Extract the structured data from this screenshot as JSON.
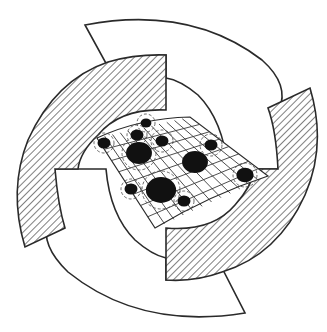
{
  "diagram": {
    "title": "",
    "colors": {
      "stroke": "#2a2a2a",
      "fill_white": "#ffffff",
      "hatch_line": "#3a3a3a",
      "blob": "#111111"
    },
    "segments": [
      {
        "id": "white-top",
        "style": "white"
      },
      {
        "id": "hatched-left",
        "style": "hatched"
      },
      {
        "id": "white-bottom",
        "style": "white"
      },
      {
        "id": "hatched-right",
        "style": "hatched"
      }
    ],
    "grid": {
      "corners": [
        [
          97,
          138
        ],
        [
          190,
          117
        ],
        [
          268,
          176
        ],
        [
          155,
          228
        ]
      ],
      "rows": 8,
      "cols": 12
    },
    "blobs": [
      {
        "cx": 146,
        "cy": 123,
        "r": 5,
        "halo": 9
      },
      {
        "cx": 137,
        "cy": 135,
        "r": 6,
        "halo": 10
      },
      {
        "cx": 104,
        "cy": 143,
        "r": 6,
        "halo": 10
      },
      {
        "cx": 162,
        "cy": 141,
        "r": 6,
        "halo": 11
      },
      {
        "cx": 139,
        "cy": 153,
        "r": 12,
        "halo": 17
      },
      {
        "cx": 211,
        "cy": 145,
        "r": 6,
        "halo": 11
      },
      {
        "cx": 195,
        "cy": 162,
        "r": 12,
        "halo": 0
      },
      {
        "cx": 245,
        "cy": 175,
        "r": 8,
        "halo": 12
      },
      {
        "cx": 131,
        "cy": 189,
        "r": 6,
        "halo": 10
      },
      {
        "cx": 161,
        "cy": 190,
        "r": 14,
        "halo": 19
      },
      {
        "cx": 184,
        "cy": 201,
        "r": 6,
        "halo": 10
      }
    ]
  }
}
